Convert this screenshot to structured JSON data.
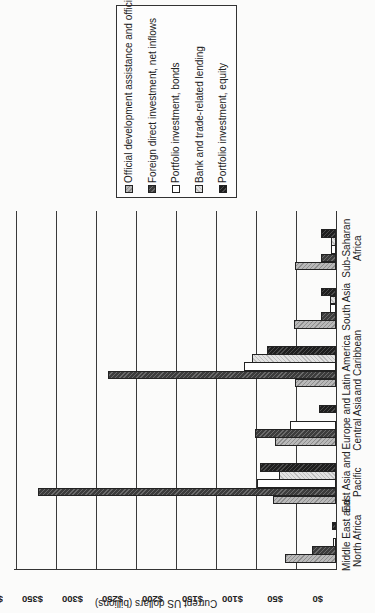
{
  "chart_data": {
    "type": "bar",
    "title": "",
    "xlabel": "",
    "ylabel": "Current US dollars (billions)",
    "ylim": [
      0,
      400
    ],
    "yticks": [
      "$0",
      "$50",
      "$100",
      "$150",
      "$200",
      "$250",
      "$300",
      "$350",
      "$400"
    ],
    "grid": true,
    "legend_position": "right",
    "orientation_note": "figure rendered rotated 90 degrees counter-clockwise",
    "categories": [
      "Middle East and North Africa",
      "East Asia and Pacific",
      "Europe and Central Asia",
      "Latin America and Caribbean",
      "South Asia",
      "Sub-Saharan Africa"
    ],
    "category_lines": [
      [
        "Middle East and",
        "North Africa"
      ],
      [
        "East Asia and",
        "Pacific"
      ],
      [
        "Europe and",
        "Central Asia"
      ],
      [
        "Latin America",
        "and Caribbean"
      ],
      [
        "South Asia",
        ""
      ],
      [
        "Sub-Saharan",
        "Africa"
      ]
    ],
    "series": [
      {
        "name": "Official development assistance and official aid",
        "values": [
          64,
          79,
          76,
          51,
          52,
          51
        ]
      },
      {
        "name": "Foreign direct investment, net inflows",
        "values": [
          30,
          372,
          101,
          285,
          19,
          19
        ]
      },
      {
        "name": "Portfolio investment, bonds",
        "values": [
          4,
          99,
          57,
          115,
          7,
          6
        ]
      },
      {
        "name": "Bank and trade-related lending",
        "values": [
          0,
          71,
          0,
          105,
          7,
          6
        ]
      },
      {
        "name": "Portfolio investment, equity",
        "values": [
          5,
          95,
          21,
          86,
          19,
          19
        ]
      }
    ]
  }
}
